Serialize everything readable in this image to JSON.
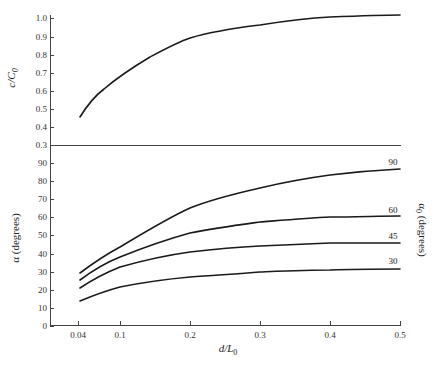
{
  "chart_data": [
    {
      "type": "line",
      "title": "",
      "xlabel": "d/L0",
      "ylabel": "c/C0",
      "xlim": [
        0.02,
        0.5
      ],
      "ylim": [
        0.3,
        1.0
      ],
      "yticks": [
        "0.3",
        "0.4",
        "0.5",
        "0.6",
        "0.7",
        "0.8",
        "0.9",
        "1.0"
      ],
      "grid": false,
      "series": [
        {
          "name": "c/C0",
          "x": [
            0.043,
            0.06,
            0.08,
            0.1,
            0.15,
            0.2,
            0.25,
            0.3,
            0.35,
            0.4,
            0.45,
            0.5
          ],
          "values": [
            0.45,
            0.52,
            0.58,
            0.66,
            0.77,
            0.89,
            0.93,
            0.96,
            0.98,
            0.99,
            1.0,
            1.0
          ]
        }
      ]
    },
    {
      "type": "line",
      "title": "",
      "xlabel": "d/L0",
      "ylabel": "α (degrees)",
      "y2label": "α0 (degrees)",
      "xlim": [
        0.02,
        0.5
      ],
      "ylim": [
        0,
        90
      ],
      "xticks": [
        "0.04",
        "0.1",
        "0.2",
        "0.3",
        "0.4",
        "0.5"
      ],
      "yticks": [
        "0",
        "10",
        "20",
        "30",
        "40",
        "50",
        "60",
        "70",
        "80",
        "90"
      ],
      "grid": false,
      "legend": "curve labels at right end: 90, 60, 45, 30 (α0 in degrees)",
      "x": [
        0.043,
        0.1,
        0.2,
        0.3,
        0.4,
        0.5
      ],
      "series": [
        {
          "name": "90",
          "values": [
            29,
            43.5,
            65,
            75,
            82,
            86.5
          ]
        },
        {
          "name": "60",
          "values": [
            25.5,
            38,
            51,
            57,
            59.5,
            60
          ]
        },
        {
          "name": "45",
          "values": [
            21,
            32.5,
            40,
            43,
            45,
            46
          ]
        },
        {
          "name": "30",
          "values": [
            14,
            21.5,
            27,
            29,
            31,
            32
          ]
        }
      ]
    }
  ],
  "labels": {
    "top_ylabel_main": "c/C",
    "top_ylabel_sub": "0",
    "bottom_ylabel": "α  (degrees)",
    "right_ylabel_main": "α",
    "right_ylabel_sub": "0",
    "right_ylabel_rest": " (degrees)",
    "xlabel_main": "d/L",
    "xlabel_sub": "0"
  },
  "top_yticks": [
    {
      "label": "1.0",
      "y": 18
    },
    {
      "label": "0.9",
      "y": 37
    },
    {
      "label": "0.8",
      "y": 55
    },
    {
      "label": "0.7",
      "y": 73
    },
    {
      "label": "0.6",
      "y": 91
    },
    {
      "label": "0.5",
      "y": 109
    },
    {
      "label": "0.4",
      "y": 127
    },
    {
      "label": "0.3",
      "y": 145
    }
  ],
  "bottom_yticks": [
    {
      "label": "90",
      "y": 163
    },
    {
      "label": "80",
      "y": 181
    },
    {
      "label": "70",
      "y": 199
    },
    {
      "label": "60",
      "y": 217
    },
    {
      "label": "50",
      "y": 235
    },
    {
      "label": "40",
      "y": 254
    },
    {
      "label": "30",
      "y": 272
    },
    {
      "label": "20",
      "y": 290
    },
    {
      "label": "10",
      "y": 308
    },
    {
      "label": "0",
      "y": 326
    }
  ],
  "xticks": [
    {
      "label": "0.04",
      "x": 78
    },
    {
      "label": "0.1",
      "x": 120
    },
    {
      "label": "0.2",
      "x": 190
    },
    {
      "label": "0.3",
      "x": 260
    },
    {
      "label": "0.4",
      "x": 330
    },
    {
      "label": "0.5",
      "x": 400
    }
  ],
  "curve_labels": [
    {
      "label": "90",
      "x": 393,
      "y": 165
    },
    {
      "label": "60",
      "x": 393,
      "y": 213
    },
    {
      "label": "45",
      "x": 393,
      "y": 239
    },
    {
      "label": "30",
      "x": 393,
      "y": 264
    }
  ]
}
